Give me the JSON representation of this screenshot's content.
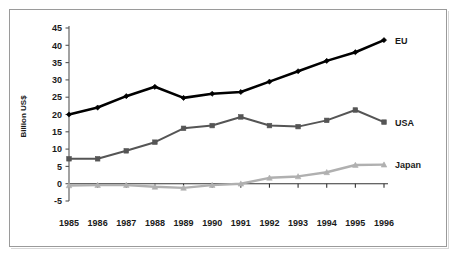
{
  "figure": {
    "frame_color": "#9a9a9a",
    "background": "#ffffff"
  },
  "chart_data": {
    "type": "line",
    "title": "",
    "subtitle": "",
    "xlabel": "",
    "ylabel": "Billion US$",
    "categories": [
      "1985",
      "1986",
      "1987",
      "1988",
      "1989",
      "1990",
      "1991",
      "1992",
      "1993",
      "1994",
      "1995",
      "1996"
    ],
    "x": [
      1985,
      1986,
      1987,
      1988,
      1989,
      1990,
      1991,
      1992,
      1993,
      1994,
      1995,
      1996
    ],
    "ylim": [
      -5,
      45
    ],
    "yticks": [
      -5,
      0,
      5,
      10,
      15,
      20,
      25,
      30,
      35,
      40,
      45
    ],
    "ytick_labels": [
      "-5",
      "0",
      "5",
      "10",
      "15",
      "20",
      "25",
      "30",
      "35",
      "40",
      "45"
    ],
    "grid": false,
    "legend_position": "right-inline-end-of-line",
    "series": [
      {
        "name": "EU",
        "color": "#000000",
        "marker": "diamond",
        "line_width": 2.6,
        "values": [
          20.0,
          22.0,
          25.3,
          28.0,
          24.8,
          26.0,
          26.5,
          29.5,
          32.5,
          35.5,
          38.0,
          41.5
        ]
      },
      {
        "name": "USA",
        "color": "#555555",
        "marker": "square",
        "line_width": 2.0,
        "values": [
          7.2,
          7.2,
          9.5,
          12.0,
          16.0,
          16.8,
          19.3,
          16.8,
          16.5,
          18.3,
          21.3,
          17.8
        ]
      },
      {
        "name": "Japan",
        "color": "#b0b0b0",
        "marker": "triangle",
        "line_width": 2.4,
        "values": [
          -0.5,
          -0.4,
          -0.4,
          -0.9,
          -1.2,
          -0.4,
          0.0,
          1.7,
          2.1,
          3.3,
          5.4,
          5.5
        ]
      }
    ]
  }
}
